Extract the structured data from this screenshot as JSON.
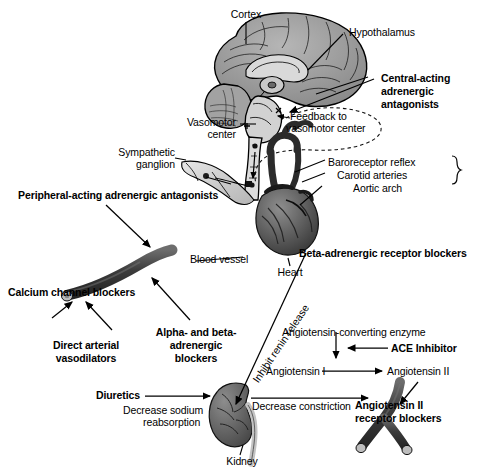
{
  "figure": {
    "background": "#ffffff",
    "ink": "#000000",
    "tissue_fill": "#8c8c8c",
    "tissue_dark": "#4d4d4d",
    "tissue_light": "#d6d6d6",
    "vessel_dark": "#3b3b3b"
  },
  "anatomy_labels": {
    "cortex": "Cortex",
    "hypothalamus": "Hypothalamus",
    "vasomotor_center_l1": "Vasomotor",
    "vasomotor_center_l2": "center",
    "sympathetic_ganglion_l1": "Sympathetic",
    "sympathetic_ganglion_l2": "ganglion",
    "blood_vessel": "Blood vessel",
    "heart": "Heart",
    "kidney": "Kidney"
  },
  "process_labels": {
    "feedback_l1": "Feedback to",
    "feedback_l2": "vasomotor center",
    "baroreceptor_reflex": "Baroreceptor reflex",
    "carotid_arteries": "Carotid arteries",
    "aortic_arch": "Aortic arch",
    "inhibit_renin_release": "Inhibit renin release",
    "ace_enzyme": "Angiotensin-converting enzyme",
    "angiotensin_i": "Angiotensin I",
    "angiotensin_ii": "Angiotensin II",
    "decrease_sodium_l1": "Decrease sodium",
    "decrease_sodium_l2": "reabsorption",
    "decrease_constriction": "Decrease constriction"
  },
  "drug_classes": [
    {
      "id": "central-acting-adrenergic-antagonists",
      "lines": [
        "Central-acting",
        "adrenergic",
        "antagonists"
      ],
      "target": "brainstem / vasomotor center"
    },
    {
      "id": "peripheral-acting-adrenergic-antagonists",
      "lines": [
        "Peripheral-acting adrenergic antagonists"
      ],
      "target": "sympathetic ganglion / blood vessel"
    },
    {
      "id": "calcium-channel-blockers",
      "lines": [
        "Calcium channel blockers"
      ],
      "target": "blood vessel"
    },
    {
      "id": "direct-arterial-vasodilators",
      "lines": [
        "Direct arterial",
        "vasodilators"
      ],
      "target": "blood vessel"
    },
    {
      "id": "alpha-and-beta-adrenergic-blockers",
      "lines": [
        "Alpha- and beta-",
        "adrenergic",
        "blockers"
      ],
      "target": "blood vessel"
    },
    {
      "id": "beta-adrenergic-receptor-blockers",
      "lines": [
        "Beta-adrenergic receptor blockers"
      ],
      "target": "heart / renin release"
    },
    {
      "id": "ace-inhibitor",
      "lines": [
        "ACE Inhibitor"
      ],
      "target": "angiotensin-converting enzyme"
    },
    {
      "id": "diuretics",
      "lines": [
        "Diuretics"
      ],
      "target": "kidney"
    },
    {
      "id": "angiotensin-ii-receptor-blockers",
      "lines": [
        "Angiotensin II",
        "receptor blockers"
      ],
      "target": "arteriole"
    }
  ]
}
